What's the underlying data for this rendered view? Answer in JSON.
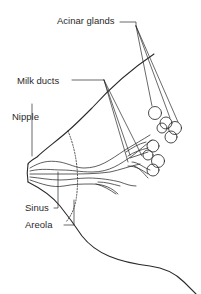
{
  "diagram": {
    "type": "anatomical illustration",
    "colors": {
      "line": "#2a2a2a",
      "background": "#ffffff"
    },
    "labels": [
      {
        "id": "acinar-glands",
        "text": "Acinar glands"
      },
      {
        "id": "milk-ducts",
        "text": "Milk ducts"
      },
      {
        "id": "nipple",
        "text": "Nipple"
      },
      {
        "id": "sinus",
        "text": "Sinus"
      },
      {
        "id": "areola",
        "text": "Areola"
      }
    ]
  }
}
